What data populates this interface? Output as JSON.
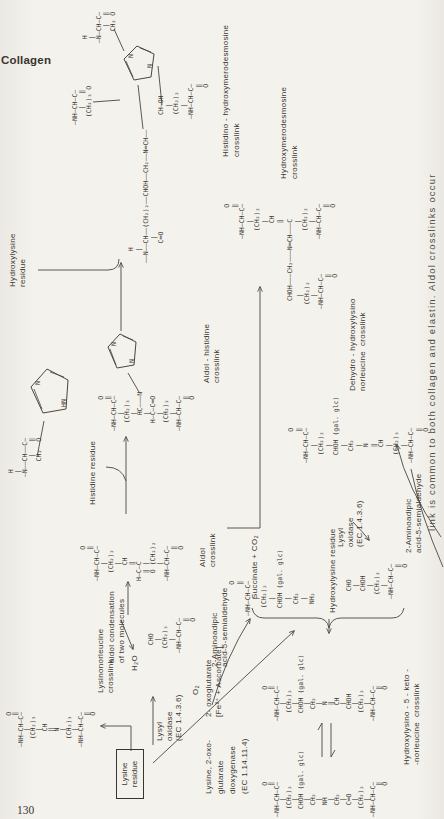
{
  "page": {
    "running_head": "Collagen",
    "page_number": "130",
    "caption": "link is common to both collagen and elastin. Aldol crosslinks occur"
  },
  "ring": {
    "n": "N",
    "hn": "HN"
  },
  "labels": {
    "lysinonorleucine": [
      "Lysinonorleucine",
      "crosslink"
    ],
    "lysine_residue": [
      "Lysine",
      "residue"
    ],
    "lysyl_oxidase_1": [
      "Lysyl",
      "oxidase",
      "(EC 1.4.3.6)"
    ],
    "aminoadipic_1": [
      "2-Aminoadipic",
      "acid-5-semialdehyde"
    ],
    "aldol_condensation": [
      "aldol condensation",
      "of two molecules"
    ],
    "h2o": "H₂O",
    "o2": "O₂",
    "aldol": [
      "Aldol",
      "crosslink"
    ],
    "histidine": "Histidine residue",
    "aldol_histidine": [
      "Aldol - histidine",
      "crosslink"
    ],
    "hydroxylysine_1": [
      "Hydroxylysine",
      "residue"
    ],
    "histidino": [
      "Histidino - hydroxymerodesmosine",
      "crosslink"
    ],
    "hydroxymerodesmosine": [
      "Hydroxymerodesmosine",
      "crosslink"
    ],
    "dioxygenase": [
      "Lysine, 2-oxo-",
      "glutarate",
      "dioxygenase",
      "(EC 1.14.11.4)"
    ],
    "oxoglutarate": [
      "2- oxoglutarate",
      "[Fe²⁺ + Ascorbate]"
    ],
    "succinate": "Succinate + CO₂",
    "hydroxylysine_2": "Hydroxylysine residue",
    "lysyl_oxidase_2": [
      "Lysyl",
      "oxidase",
      "(EC 1.4.3.6)"
    ],
    "aminoadipic_2": [
      "2-Aminoadipic",
      "acid-5-semialdehyde"
    ],
    "dehydro": [
      "Dehydro - hydroxylysino",
      "norleucine  crosslink"
    ],
    "keto": [
      "Hydroxylysino - 5 - keto -",
      "-norleucine  crosslink"
    ]
  },
  "structures": {
    "lysinonorleucine": [
      "         O",
      "         ‖",
      " —NH—CH—C—",
      "     |",
      "   (CH₂)₃",
      "     |",
      "     CH",
      "     ‖",
      "     N",
      "     |",
      "   (CH₂)₃",
      "     |",
      " —NH—CH—C—",
      "         ‖",
      "         O"
    ],
    "semialdehyde1": [
      "  CHO",
      "   |",
      " (CH₂)₃",
      "   |",
      "—NH—CH—C—",
      "        ‖",
      "        O"
    ],
    "aldol": [
      "        O",
      "        ‖",
      "—NH—CH—C—",
      "    |",
      "  (CH₂)₂",
      "    |",
      "    CH",
      "    ‖",
      "H—C—C",
      "  ‖ |",
      "  O (CH₂)₂",
      "    |",
      "—NH—CH—C—",
      "        ‖",
      "        O"
    ],
    "histidine": [
      "  H",
      "  |",
      " —N——CH——C—",
      "      |   ‖",
      "     CH₂  O"
    ],
    "aldol_histidine": [
      "        O",
      "        ‖",
      "—NH—CH—C—",
      "    |",
      "  (CH₂)₃",
      "    |",
      "    HC———N",
      "    |",
      "  H—C—C═O",
      "    |",
      "  (CH₂)₂",
      "    |",
      "—NH—CH—C—",
      "        ‖",
      "        O"
    ],
    "final_arm1": [
      "—NH—CH—C—",
      "    |   ‖",
      "  (CH₂)₃ O"
    ],
    "final_arm2": [
      "  H",
      "  |",
      " —N—CH—C—",
      "     |  ‖",
      "    CH₂ O"
    ],
    "final_chain": [
      "   H",
      "   |",
      "——N——CH——(CH₂)₂——CHOH——CH₂——N═CH——",
      "      |",
      "     C═O"
    ],
    "final_arm4": [
      " CH—OH",
      "   |",
      " (CH₂)₂",
      "   |",
      "—NH—CH—C—",
      "        ‖",
      "        O"
    ],
    "mero_top": [
      "        O",
      "        ‖",
      "—NH—CH—C—",
      "    |",
      "  (CH₂)₂",
      "    |",
      "    CH",
      "    ‖"
    ],
    "mero_chain": "CHOH———CH₂———N═CH———C",
    "mero_arm_right": [
      "    |",
      "  (CH₂)₂",
      "    |",
      "—NH—CH—C—",
      "        ‖",
      "        O"
    ],
    "mero_arm_left": [
      "   |",
      " (CH₂)₂",
      "   |",
      "—NH—CH—C—",
      "        ‖",
      "        O"
    ],
    "hydroxylysine": [
      "        O",
      "        ‖",
      "—NH—CH—C—",
      "    |",
      "  (CH₂)₂",
      "    |",
      "  CHOH (gal. glc)",
      "    |",
      "   CH₂",
      "    |",
      "   NH₂"
    ],
    "semialdehyde2": [
      "  CHO",
      "   |",
      "  CHOH",
      "   |",
      " (CH₂)₂",
      "   |",
      "—NH—CH—C—",
      "        ‖",
      "        O"
    ],
    "dehydro_glc": [
      "        O",
      "        ‖",
      "—NH—CH—C—",
      "    |",
      "  (CH₂)₂",
      "    |",
      "  CHOH (gal. glc)",
      "    |",
      "   CH₂",
      "    |",
      "    N",
      "    ‖",
      "    CH",
      "    |",
      "   CHOH",
      "    |",
      "  (CH₂)₂",
      "    |",
      "—NH—CH—C—",
      "        ‖",
      "        O"
    ],
    "keto": [
      "        O",
      "        ‖",
      "—NH—CH—C—",
      "    |",
      "  (CH₂)₂",
      "    |",
      "  CHOH (gal. glc)",
      "    |",
      "   CH₂",
      "    |",
      "   NH",
      "    |",
      "   CH₂",
      "    |",
      "   C═O",
      "    |",
      "  (CH₂)₂",
      "    |",
      "—NH—CH—C—",
      "        ‖",
      "        O"
    ],
    "dehydro": [
      "        O",
      "        ‖",
      "—NH—CH—C—",
      "    |",
      "  (CH₂)₂",
      "    |",
      "  CHOH (gal. glc)",
      "    |",
      "   CH₂",
      "    |",
      "    N",
      "    ‖",
      "    CH",
      "    |",
      "  (CH₂)₃",
      "    |",
      "—NH—CH—C—",
      "        ‖",
      "        O"
    ]
  }
}
